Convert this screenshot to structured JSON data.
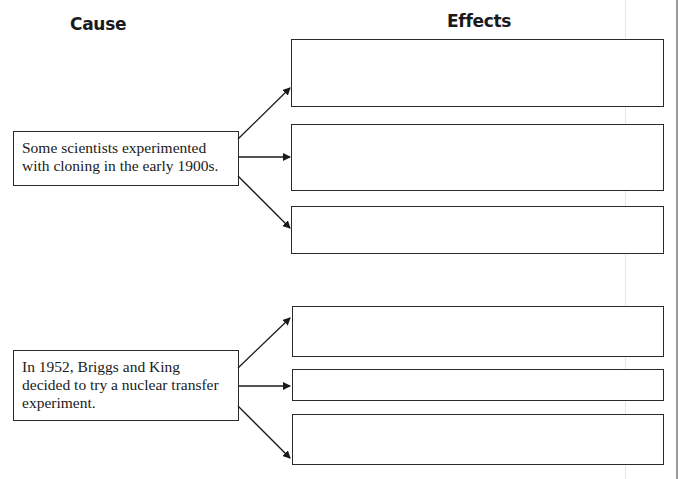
{
  "headings": {
    "cause": "Cause",
    "effects": "Effects"
  },
  "groups": [
    {
      "cause_text": "Some scientists experimented with cloning in the early 1900s.",
      "cause_lines": [
        "Some scientists experimented",
        "with cloning in the early 1900s."
      ],
      "effects": [
        "",
        "",
        ""
      ]
    },
    {
      "cause_text": "In 1952, Briggs and King decided to try a nuclear transfer experiment.",
      "cause_lines": [
        "In 1952, Briggs and King",
        "decided to try a nuclear transfer",
        "experiment."
      ],
      "effects": [
        "",
        "",
        ""
      ]
    }
  ],
  "colors": {
    "line": "#2a2a2a",
    "background": "#ffffff"
  }
}
